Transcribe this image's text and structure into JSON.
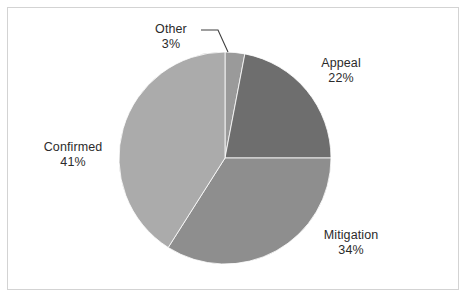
{
  "chart_data": {
    "type": "pie",
    "title": "",
    "subtitle": "",
    "xlabel": "",
    "ylabel": "",
    "grid": false,
    "legend_position": "none",
    "labels_position": "outside",
    "start_angle_deg": 0,
    "direction": "clockwise",
    "categories": [
      "Other",
      "Appeal",
      "Mitigation",
      "Confirmed"
    ],
    "values": [
      3,
      22,
      34,
      41
    ],
    "value_unit": "%",
    "slices": [
      {
        "name": "Other",
        "value": 3,
        "value_label": "3%",
        "color": "#9a9a9a"
      },
      {
        "name": "Appeal",
        "value": 22,
        "value_label": "22%",
        "color": "#6e6e6e"
      },
      {
        "name": "Mitigation",
        "value": 34,
        "value_label": "34%",
        "color": "#8e8e8e"
      },
      {
        "name": "Confirmed",
        "value": 41,
        "value_label": "41%",
        "color": "#ababab"
      }
    ],
    "total": 100,
    "annotations": [
      {
        "name": "other-leader-line",
        "for": "Other",
        "type": "leader-line"
      }
    ]
  },
  "labels": {
    "other": {
      "name": "Other",
      "value": "3%"
    },
    "appeal": {
      "name": "Appeal",
      "value": "22%"
    },
    "confirmed": {
      "name": "Confirmed",
      "value": "41%"
    },
    "mitigation": {
      "name": "Mitigation",
      "value": "34%"
    }
  },
  "style": {
    "background": "#ffffff",
    "border_color": "#d3d3d3",
    "text_color": "#2b2b2b",
    "leader_line_color": "#3f3f3f"
  }
}
